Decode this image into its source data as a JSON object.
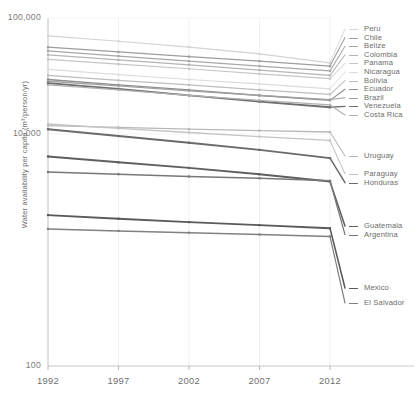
{
  "chart_data": {
    "type": "line",
    "title": "",
    "xlabel": "",
    "ylabel": "Water availability per capita (m³/person/yr)",
    "x": [
      1992,
      1997,
      2002,
      2007,
      2012
    ],
    "xtick_labels": [
      "1992",
      "1997",
      "2002",
      "2007",
      "2012"
    ],
    "ytick_labels": [
      "100,000",
      "10,000",
      "100"
    ],
    "ytick_values": [
      100000,
      10000,
      100
    ],
    "yscale": "log",
    "ylim": [
      100,
      100000
    ],
    "grid": "vertical-light",
    "legend_position": "right-outside-at-line-end",
    "series": [
      {
        "name": "Peru",
        "color": "#d3d3d3",
        "width": 1.2,
        "values": [
          70000,
          63000,
          56000,
          49000,
          41000
        ]
      },
      {
        "name": "Chile",
        "color": "#9d9d9d",
        "width": 1.3,
        "values": [
          56000,
          51000,
          46500,
          42500,
          38500
        ]
      },
      {
        "name": "Belize",
        "color": "#a8a8a8",
        "width": 1.3,
        "values": [
          52000,
          47000,
          42500,
          38500,
          35000
        ]
      },
      {
        "name": "Colombia",
        "color": "#b5b5b5",
        "width": 1.3,
        "values": [
          48000,
          43500,
          39500,
          35500,
          32000
        ]
      },
      {
        "name": "Panama",
        "color": "#c6c6c6",
        "width": 1.2,
        "values": [
          44000,
          40000,
          36500,
          33000,
          30000
        ]
      },
      {
        "name": "Nicaragua",
        "color": "#dcdcdc",
        "width": 1.2,
        "values": [
          36000,
          32500,
          29500,
          27000,
          24500
        ]
      },
      {
        "name": "Bolivia",
        "color": "#bdbdbd",
        "width": 1.3,
        "values": [
          32000,
          29000,
          26500,
          24000,
          22000
        ]
      },
      {
        "name": "Ecuador",
        "color": "#8e8e8e",
        "width": 1.4,
        "values": [
          29500,
          26500,
          24000,
          21500,
          19500
        ]
      },
      {
        "name": "Brazil",
        "color": "#a0a0a0",
        "width": 1.3,
        "values": [
          28500,
          26000,
          23500,
          21500,
          19800
        ]
      },
      {
        "name": "Venezuela",
        "color": "#6d6d6d",
        "width": 1.8,
        "values": [
          27500,
          24500,
          21500,
          19000,
          17000
        ]
      },
      {
        "name": "Costa Rica",
        "color": "#b0b0b0",
        "width": 1.3,
        "values": [
          26500,
          24000,
          21500,
          19500,
          17800
        ]
      },
      {
        "name": "Uruguay",
        "color": "#b8b8b8",
        "width": 1.3,
        "values": [
          11800,
          11400,
          11000,
          10700,
          10400
        ]
      },
      {
        "name": "Paraguay",
        "color": "#c4c4c4",
        "width": 1.3,
        "values": [
          12200,
          11200,
          10300,
          9500,
          8800
        ]
      },
      {
        "name": "Honduras",
        "color": "#6a6a6a",
        "width": 1.9,
        "values": [
          11000,
          9600,
          8400,
          7300,
          6200
        ]
      },
      {
        "name": "Guatemala",
        "color": "#5f5f5f",
        "width": 1.9,
        "values": [
          6400,
          5700,
          5100,
          4500,
          3900
        ]
      },
      {
        "name": "Argentina",
        "color": "#777777",
        "width": 1.6,
        "values": [
          4700,
          4500,
          4300,
          4150,
          3950
        ]
      },
      {
        "name": "Mexico",
        "color": "#5a5a5a",
        "width": 1.9,
        "values": [
          2000,
          1860,
          1740,
          1640,
          1540
        ]
      },
      {
        "name": "El Salvador",
        "color": "#808080",
        "width": 1.5,
        "values": [
          1520,
          1460,
          1410,
          1360,
          1310
        ]
      }
    ],
    "legend_groups": [
      {
        "labels": [
          "Peru",
          "Chile",
          "Belize",
          "Colombia",
          "Panama",
          "Nicaragua",
          "Bolivia",
          "Ecuador",
          "Brazil",
          "Venezuela",
          "Costa Rica"
        ]
      },
      {
        "labels": [
          "Uruguay"
        ]
      },
      {
        "labels": [
          "Paraguay",
          "Honduras"
        ]
      },
      {
        "labels": [
          "Guatemala",
          "Argentina"
        ]
      },
      {
        "labels": [
          "Mexico"
        ]
      },
      {
        "labels": [
          "El Salvador"
        ]
      }
    ]
  }
}
